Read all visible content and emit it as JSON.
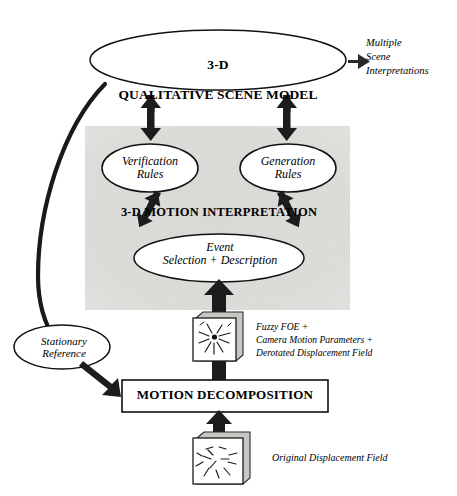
{
  "figure": {
    "background_color": "#ffffff",
    "ink_color": "#000000",
    "shaded_region_color": "#e2e0de"
  },
  "nodes": {
    "scene_model": {
      "shape": "ellipse",
      "line1": "3-D",
      "line2": "QUALITATIVE SCENE MODEL",
      "style": "bold"
    },
    "verification_rules": {
      "shape": "ellipse",
      "label": "Verification\nRules",
      "style": "italic"
    },
    "generation_rules": {
      "shape": "ellipse",
      "label": "Generation\nRules",
      "style": "italic"
    },
    "event_node": {
      "shape": "ellipse",
      "label": "Event\nSelection + Description",
      "style": "italic"
    },
    "stationary_reference": {
      "shape": "ellipse",
      "label": "Stationary\nReference",
      "style": "italic"
    },
    "motion_decomposition": {
      "shape": "rectangle",
      "label": "MOTION DECOMPOSITION",
      "style": "bold"
    }
  },
  "regions": {
    "motion_interpretation": {
      "label": "3-D MOTION INTERPRETATION",
      "style": "bold",
      "fill": "#e2e0de"
    }
  },
  "annotations": {
    "multiple_scene_interpretations": "Multiple\nScene\nInterpretations",
    "fuzzy_foe": "Fuzzy FOE +\nCamera Motion Parameters +\nDerotated Displacement Field",
    "original_displacement_field": "Original Displacement Field"
  },
  "icons": {
    "foe_image_stack": "image-stack-foe-icon",
    "displacement_image_stack": "image-stack-displacement-icon",
    "arrow_right": "arrow-right-icon",
    "arrow_up": "arrow-up-icon",
    "arrow_down": "arrow-down-icon",
    "arrow_double_vertical": "double-headed-vertical-arrow-icon",
    "arrow_double_diagonal": "double-headed-diagonal-arrow-icon",
    "feedback_curve": "feedback-curve-icon"
  }
}
